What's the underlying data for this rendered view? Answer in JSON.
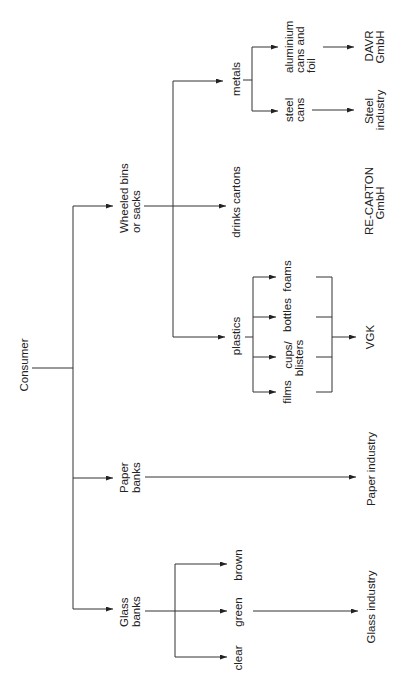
{
  "diagram": {
    "orientation": "rotated-90-ccw",
    "colors": {
      "background": "#ffffff",
      "line": "#333333",
      "text": "#222222"
    }
  },
  "nodes": {
    "consumer": "Consumer",
    "wheeled_bins": {
      "line1": "Wheeled bins",
      "line2": "or sacks"
    },
    "paper_banks": {
      "line1": "Paper",
      "line2": "banks"
    },
    "glass_banks": {
      "line1": "Glass",
      "line2": "banks"
    },
    "metals": "metals",
    "drinks_cartons": "drinks cartons",
    "plastics": "plastics",
    "aluminium": {
      "line1": "aluminium",
      "line2": "cans and",
      "line3": "foil"
    },
    "steel_cans": {
      "line1": "steel",
      "line2": "cans"
    },
    "foams": "foams",
    "bottles": "bottles",
    "cups_blisters": {
      "line1": "cups/",
      "line2": "blisters"
    },
    "films": "films",
    "brown": "brown",
    "green": "green",
    "clear": "clear",
    "davr": {
      "line1": "DAVR",
      "line2": "GmbH"
    },
    "steel_industry": {
      "line1": "Steel",
      "line2": "industry"
    },
    "recarton": {
      "line1": "RE-CARTON",
      "line2": "GmbH"
    },
    "vgk": "VGK",
    "paper_industry": "Paper industry",
    "glass_industry": "Glass industry"
  },
  "edges": [
    [
      "Consumer",
      "Wheeled bins or sacks"
    ],
    [
      "Consumer",
      "Paper banks"
    ],
    [
      "Consumer",
      "Glass banks"
    ],
    [
      "Wheeled bins or sacks",
      "metals"
    ],
    [
      "Wheeled bins or sacks",
      "drinks cartons"
    ],
    [
      "Wheeled bins or sacks",
      "plastics"
    ],
    [
      "metals",
      "aluminium cans and foil"
    ],
    [
      "metals",
      "steel cans"
    ],
    [
      "aluminium cans and foil",
      "DAVR GmbH"
    ],
    [
      "steel cans",
      "Steel industry"
    ],
    [
      "drinks cartons",
      "RE-CARTON GmbH"
    ],
    [
      "plastics",
      "foams"
    ],
    [
      "plastics",
      "bottles"
    ],
    [
      "plastics",
      "cups/ blisters"
    ],
    [
      "plastics",
      "films"
    ],
    [
      "foams",
      "VGK"
    ],
    [
      "bottles",
      "VGK"
    ],
    [
      "cups/ blisters",
      "VGK"
    ],
    [
      "films",
      "VGK"
    ],
    [
      "Paper banks",
      "Paper industry"
    ],
    [
      "Glass banks",
      "brown"
    ],
    [
      "Glass banks",
      "green"
    ],
    [
      "Glass banks",
      "clear"
    ],
    [
      "green",
      "Glass industry"
    ]
  ]
}
